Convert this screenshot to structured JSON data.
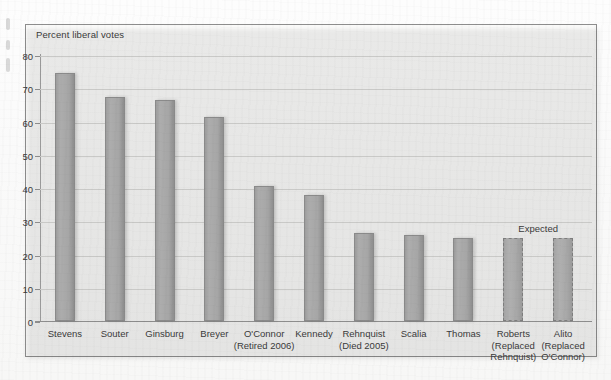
{
  "chart_data": {
    "type": "bar",
    "title": "",
    "ylabel": "Percent liberal votes",
    "xlabel": "",
    "ylim": [
      0,
      80
    ],
    "yticks": [
      0,
      10,
      20,
      30,
      40,
      50,
      60,
      70,
      80
    ],
    "grid": true,
    "legend": "none",
    "annotations": [
      {
        "text": "Expected",
        "over_categories": [
          "Roberts",
          "Alito"
        ]
      }
    ],
    "categories": [
      "Stevens",
      "Souter",
      "Ginsburg",
      "Breyer",
      "O'Connor",
      "Kennedy",
      "Rehnquist",
      "Scalia",
      "Thomas",
      "Roberts",
      "Alito"
    ],
    "category_sublabels": [
      "",
      "",
      "",
      "",
      "(Retired 2006)",
      "",
      "(Died 2005)",
      "",
      "",
      "(Replaced Rehnquist)",
      "(Replaced O'Connor)"
    ],
    "values": [
      74.5,
      67.5,
      66.5,
      61.5,
      40.5,
      38,
      26.5,
      26,
      25,
      25,
      25
    ],
    "bar_styles": [
      "solid",
      "solid",
      "solid",
      "solid",
      "solid",
      "solid",
      "solid",
      "solid",
      "solid",
      "dashed",
      "dashed"
    ]
  },
  "bars": [
    {
      "name": "Stevens",
      "sub": "",
      "value": 74.5,
      "style": "solid"
    },
    {
      "name": "Souter",
      "sub": "",
      "value": 67.5,
      "style": "solid"
    },
    {
      "name": "Ginsburg",
      "sub": "",
      "value": 66.5,
      "style": "solid"
    },
    {
      "name": "Breyer",
      "sub": "",
      "value": 61.5,
      "style": "solid"
    },
    {
      "name": "O'Connor",
      "sub": "(Retired 2006)",
      "value": 40.5,
      "style": "solid"
    },
    {
      "name": "Kennedy",
      "sub": "",
      "value": 38.0,
      "style": "solid"
    },
    {
      "name": "Rehnquist",
      "sub": "(Died 2005)",
      "value": 26.5,
      "style": "solid"
    },
    {
      "name": "Scalia",
      "sub": "",
      "value": 26.0,
      "style": "solid"
    },
    {
      "name": "Thomas",
      "sub": "",
      "value": 25.0,
      "style": "solid"
    },
    {
      "name": "Roberts",
      "sub": "(Replaced Rehnquist)",
      "value": 25.0,
      "style": "dashed"
    },
    {
      "name": "Alito",
      "sub": "(Replaced O'Connor)",
      "value": 25.0,
      "style": "dashed"
    }
  ],
  "axis": {
    "title": "Percent liberal votes",
    "ticks": [
      "80",
      "70",
      "60",
      "50",
      "40",
      "30",
      "20",
      "10",
      "0"
    ]
  },
  "annotation": {
    "expected_label": "Expected"
  },
  "colors": {
    "bar_fill": "#a6a6a6",
    "bar_stroke": "#8a8a8a",
    "gridline": "#c9c9c7",
    "axis": "#8d8d8d",
    "text": "#3a3a3a",
    "frame_bg": "#f8f8f7"
  }
}
